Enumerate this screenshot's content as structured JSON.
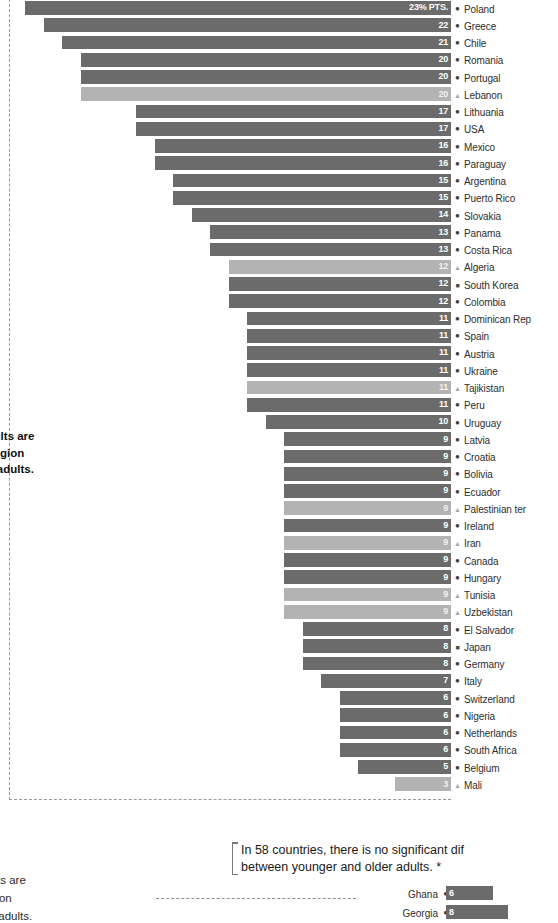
{
  "chart_data": {
    "type": "bar",
    "title": "",
    "subtitle": "",
    "xlabel": "",
    "ylabel": "",
    "unit_label": "23% PTS.",
    "value_unit": "percentage points",
    "orientation": "horizontal",
    "grid": false,
    "legend_position": "none",
    "xlim": [
      0,
      23
    ],
    "sections": [
      {
        "name": "younger-more-religious",
        "direction": "left",
        "categories": [
          "Poland",
          "Greece",
          "Chile",
          "Romania",
          "Portugal",
          "Lebanon",
          "Lithuania",
          "USA",
          "Mexico",
          "Paraguay",
          "Argentina",
          "Puerto Rico",
          "Slovakia",
          "Panama",
          "Costa Rica",
          "Algeria",
          "South Korea",
          "Colombia",
          "Dominican Rep",
          "Spain",
          "Austria",
          "Ukraine",
          "Tajikistan",
          "Peru",
          "Uruguay",
          "Latvia",
          "Croatia",
          "Bolivia",
          "Ecuador",
          "Palestinian ter",
          "Ireland",
          "Iran",
          "Canada",
          "Hungary",
          "Tunisia",
          "Uzbekistan",
          "El Salvador",
          "Japan",
          "Germany",
          "Italy",
          "Switzerland",
          "Nigeria",
          "Netherlands",
          "South Africa",
          "Belgium",
          "Mali"
        ],
        "values": [
          23,
          22,
          21,
          20,
          20,
          20,
          17,
          17,
          16,
          16,
          15,
          15,
          14,
          13,
          13,
          12,
          12,
          12,
          11,
          11,
          11,
          11,
          11,
          11,
          10,
          9,
          9,
          9,
          9,
          9,
          9,
          9,
          9,
          9,
          9,
          9,
          8,
          8,
          8,
          7,
          6,
          6,
          6,
          6,
          5,
          3
        ],
        "value_labels": [
          "23% PTS.",
          "22",
          "21",
          "20",
          "20",
          "20",
          "17",
          "17",
          "16",
          "16",
          "15",
          "15",
          "14",
          "13",
          "13",
          "12",
          "12",
          "12",
          "11",
          "11",
          "11",
          "11",
          "11",
          "11",
          "10",
          "9",
          "9",
          "9",
          "9",
          "9",
          "9",
          "9",
          "9",
          "9",
          "9",
          "9",
          "8",
          "8",
          "8",
          "7",
          "6",
          "6",
          "6",
          "6",
          "5",
          "3"
        ],
        "markers": [
          "circle",
          "circle",
          "circle",
          "circle",
          "circle",
          "triangle",
          "circle",
          "circle",
          "circle",
          "circle",
          "circle",
          "circle",
          "circle",
          "circle",
          "circle",
          "triangle",
          "square",
          "circle",
          "circle",
          "circle",
          "circle",
          "circle",
          "triangle",
          "circle",
          "circle",
          "circle",
          "circle",
          "circle",
          "circle",
          "triangle",
          "circle",
          "triangle",
          "circle",
          "circle",
          "triangle",
          "triangle",
          "circle",
          "square",
          "circle",
          "circle",
          "circle",
          "circle",
          "circle",
          "circle",
          "circle",
          "triangle"
        ],
        "bar_shades": [
          "dark",
          "dark",
          "dark",
          "dark",
          "dark",
          "light",
          "dark",
          "dark",
          "dark",
          "dark",
          "dark",
          "dark",
          "dark",
          "dark",
          "dark",
          "light",
          "dark",
          "dark",
          "dark",
          "dark",
          "dark",
          "dark",
          "light",
          "dark",
          "dark",
          "dark",
          "dark",
          "dark",
          "dark",
          "light",
          "dark",
          "light",
          "dark",
          "dark",
          "light",
          "light",
          "dark",
          "dark",
          "dark",
          "dark",
          "dark",
          "dark",
          "dark",
          "dark",
          "dark",
          "light"
        ]
      },
      {
        "name": "older-more-religious",
        "direction": "right",
        "categories": [
          "Ghana",
          "Georgia"
        ],
        "values": [
          6,
          8
        ],
        "value_labels": [
          "6",
          "8"
        ],
        "markers": [
          "circle",
          "circle"
        ],
        "bar_shades": [
          "dark",
          "dark"
        ]
      }
    ]
  },
  "annotations": {
    "upper": "…younger adults are …consider religion …than older adults.",
    "upper_lines": [
      "ounger adults are",
      "onsider religion",
      "than older adults."
    ],
    "callout_lines": [
      "In 58 countries, there is no significant dif",
      "between younger and older adults. *"
    ],
    "lower_lines": [
      "es, older adults are",
      " consider religion",
      " than younger adults."
    ]
  },
  "colors": {
    "bar_dark": "#6b6b6b",
    "bar_light": "#b3b3b3",
    "text": "#1a1a1a",
    "axis_dash": "#9a9a9a",
    "background": "#ffffff"
  },
  "icons": {
    "circle": "●",
    "triangle": "▲",
    "square": "■"
  }
}
